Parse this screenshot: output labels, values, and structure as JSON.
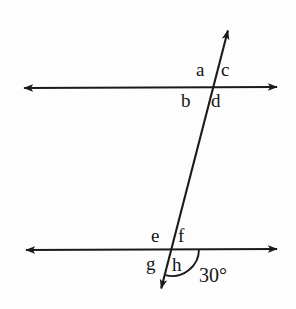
{
  "figure": {
    "background_color": "#fdfdfd",
    "stroke_color": "#1a1a1a",
    "lines": [
      {
        "name": "top-parallel-line",
        "kind": "double-arrow-line",
        "x1": 20,
        "y1": 88,
        "x2": 281,
        "y2": 87
      },
      {
        "name": "bottom-parallel-line",
        "kind": "double-arrow-line",
        "x1": 22,
        "y1": 250,
        "x2": 281,
        "y2": 249
      },
      {
        "name": "transversal-line",
        "kind": "double-arrow-line",
        "x1": 229,
        "y1": 26,
        "x2": 160,
        "y2": 293
      }
    ],
    "intersections": [
      {
        "name": "top-intersection",
        "x": 212,
        "y": 88
      },
      {
        "name": "bottom-intersection",
        "x": 172,
        "y": 249
      }
    ],
    "angle_labels": [
      {
        "id": "a",
        "text": "a",
        "x": 196,
        "y": 62,
        "position": "top-left-of-upper-intersection"
      },
      {
        "id": "c",
        "text": "c",
        "x": 220,
        "y": 62,
        "position": "top-right-of-upper-intersection"
      },
      {
        "id": "b",
        "text": "b",
        "x": 181,
        "y": 92,
        "position": "bottom-left-of-upper-intersection"
      },
      {
        "id": "d",
        "text": "d",
        "x": 211,
        "y": 92,
        "position": "bottom-right-of-upper-intersection"
      },
      {
        "id": "e",
        "text": "e",
        "x": 151,
        "y": 228,
        "position": "top-left-of-lower-intersection"
      },
      {
        "id": "f",
        "text": "f",
        "x": 178,
        "y": 227,
        "position": "top-right-of-lower-intersection"
      },
      {
        "id": "g",
        "text": "g",
        "x": 146,
        "y": 256,
        "position": "bottom-left-of-lower-intersection"
      },
      {
        "id": "h",
        "text": "h",
        "x": 172,
        "y": 256,
        "position": "bottom-right-of-lower-intersection"
      }
    ],
    "measured_angle": {
      "name": "angle-measure-30",
      "text": "30°",
      "value": 30,
      "unit": "degrees",
      "label_x": 199,
      "label_y": 266,
      "arc": {
        "center_x": 172,
        "center_y": 249,
        "radius": 27,
        "start_x": 199,
        "start_y": 249,
        "end_x": 165,
        "end_y": 274
      }
    }
  }
}
